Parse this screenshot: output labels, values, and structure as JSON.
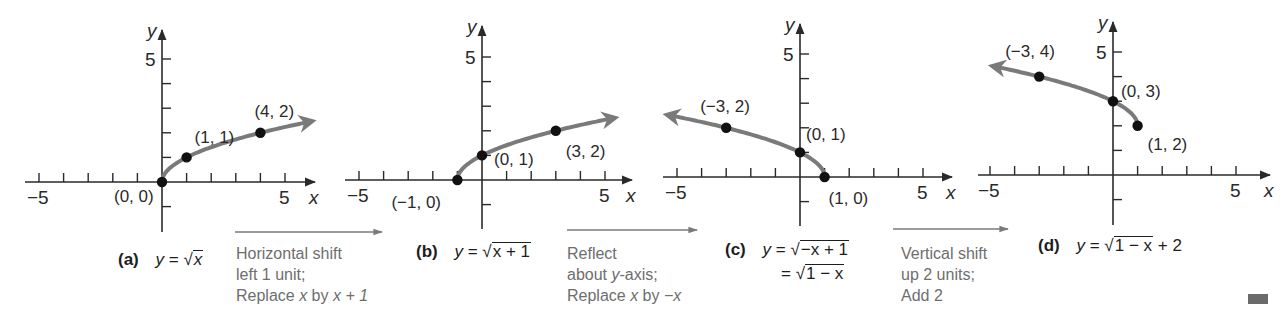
{
  "figure": {
    "axis_color": "#2a2a2a",
    "curve_color": "#7a7a7a",
    "point_color": "#111111",
    "step_text_color": "#6e6e6e",
    "unit_px": 24.6
  },
  "chart_data": [
    {
      "type": "line",
      "panel": "a",
      "title": "(a) y = √x",
      "equation": "y = √x",
      "xlabel": "x",
      "ylabel": "y",
      "xlim": [
        -5,
        5
      ],
      "ylim": [
        -1,
        5
      ],
      "tick_labels": {
        "x": [
          "−5",
          "5"
        ],
        "y": [
          "5"
        ]
      },
      "curve_domain": [
        0,
        6
      ],
      "arrow": "right",
      "points": [
        {
          "x": 0,
          "y": 0,
          "label": "(0, 0)"
        },
        {
          "x": 1,
          "y": 1,
          "label": "(1, 1)"
        },
        {
          "x": 4,
          "y": 2,
          "label": "(4, 2)"
        }
      ]
    },
    {
      "type": "line",
      "panel": "b",
      "title": "(b) y = √(x + 1)",
      "equation": "y = √(x + 1)",
      "xlabel": "x",
      "ylabel": "y",
      "xlim": [
        -5,
        5
      ],
      "ylim": [
        -1,
        5
      ],
      "tick_labels": {
        "x": [
          "−5",
          "5"
        ],
        "y": [
          "5"
        ]
      },
      "curve_domain": [
        -1,
        5.3
      ],
      "arrow": "right",
      "points": [
        {
          "x": -1,
          "y": 0,
          "label": "(−1, 0)"
        },
        {
          "x": 0,
          "y": 1,
          "label": "(0, 1)"
        },
        {
          "x": 3,
          "y": 2,
          "label": "(3, 2)"
        }
      ]
    },
    {
      "type": "line",
      "panel": "c",
      "title": "(c) y = √(−x + 1) = √(1 − x)",
      "equation": "y = √(−x + 1) = √(1 − x)",
      "xlabel": "x",
      "ylabel": "y",
      "xlim": [
        -5,
        5
      ],
      "ylim": [
        -1,
        5
      ],
      "tick_labels": {
        "x": [
          "−5",
          "5"
        ],
        "y": [
          "5"
        ]
      },
      "curve_domain": [
        -5.3,
        1
      ],
      "arrow": "left",
      "points": [
        {
          "x": -3,
          "y": 2,
          "label": "(−3, 2)"
        },
        {
          "x": 0,
          "y": 1,
          "label": "(0, 1)"
        },
        {
          "x": 1,
          "y": 0,
          "label": "(1, 0)"
        }
      ]
    },
    {
      "type": "line",
      "panel": "d",
      "title": "(d) y = √(1 − x) + 2",
      "equation": "y = √(1 − x) + 2",
      "xlabel": "x",
      "ylabel": "y",
      "xlim": [
        -5,
        5
      ],
      "ylim": [
        -1,
        5
      ],
      "tick_labels": {
        "x": [
          "−5",
          "5"
        ],
        "y": [
          "5"
        ]
      },
      "curve_domain": [
        -4.8,
        1
      ],
      "arrow": "left",
      "points": [
        {
          "x": -3,
          "y": 4,
          "label": "(−3, 4)"
        },
        {
          "x": 0,
          "y": 3,
          "label": "(0, 3)"
        },
        {
          "x": 1,
          "y": 2,
          "label": "(1, 2)"
        }
      ]
    }
  ],
  "captions": {
    "a": {
      "tag": "(a)",
      "lhs": "y",
      "eq": "=",
      "rad": "x",
      "tail": ""
    },
    "b": {
      "tag": "(b)",
      "lhs": "y",
      "eq": "=",
      "rad": "x + 1",
      "tail": ""
    },
    "c": {
      "tag": "(c)",
      "lhs": "y",
      "eq": "=",
      "rad": "−x + 1",
      "eq2": "=",
      "rad2": "1 − x"
    },
    "d": {
      "tag": "(d)",
      "lhs": "y",
      "eq": "=",
      "rad": "1 − x",
      "tail": "+ 2"
    }
  },
  "steps": [
    {
      "line1": "Horizontal shift",
      "line2": "left 1 unit;",
      "line3_pre": "Replace ",
      "line3_var": "x",
      "line3_mid": " by ",
      "line3_post": "x + 1"
    },
    {
      "line1": "Reflect",
      "line2_pre": "about ",
      "line2_var": "y",
      "line2_post": "-axis;",
      "line3_pre": "Replace ",
      "line3_var": "x",
      "line3_mid": " by ",
      "line3_post": "−x"
    },
    {
      "line1": "Vertical shift",
      "line2": "up 2 units;",
      "line3": "Add 2"
    }
  ]
}
